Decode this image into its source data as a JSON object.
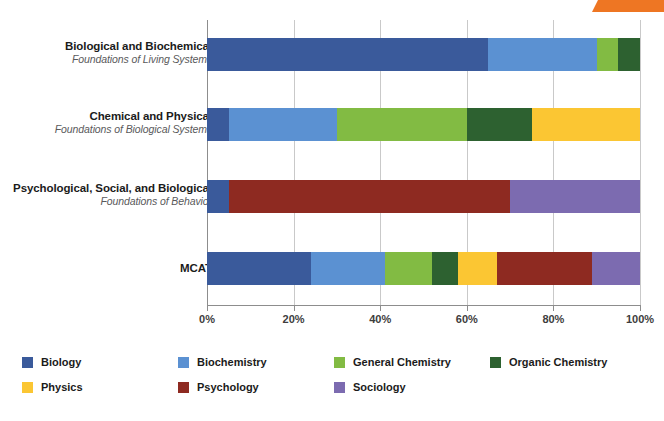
{
  "decor": {
    "corner_flag_color": "#ee7623"
  },
  "chart_data": {
    "type": "bar",
    "orientation": "horizontal",
    "stacked": true,
    "title": "",
    "xlabel": "",
    "ylabel": "",
    "xlim": [
      0,
      100
    ],
    "xticks": [
      0,
      20,
      40,
      60,
      80,
      100
    ],
    "xtick_labels": [
      "0%",
      "20%",
      "40%",
      "60%",
      "80%",
      "100%"
    ],
    "grid": true,
    "grid_axis": "x",
    "legend_position": "bottom",
    "categories": [
      "Biological and Biochemical",
      "Chemical and Physical",
      "Psychological, Social, and Biological",
      "MCAT"
    ],
    "category_subtitles": [
      "Foundations of Living Systems",
      "Foundations of Biological Systems",
      "Foundations of Behavior",
      ""
    ],
    "series": [
      {
        "name": "Biology",
        "color": "#3a5a9b",
        "values": [
          65,
          5,
          5,
          24
        ]
      },
      {
        "name": "Biochemistry",
        "color": "#5b91d2",
        "values": [
          25,
          25,
          0,
          17
        ]
      },
      {
        "name": "General Chemistry",
        "color": "#82bb43",
        "values": [
          5,
          30,
          0,
          11
        ]
      },
      {
        "name": "Organic Chemistry",
        "color": "#2d6130",
        "values": [
          5,
          15,
          0,
          6
        ]
      },
      {
        "name": "Physics",
        "color": "#fbc633",
        "values": [
          0,
          25,
          0,
          9
        ]
      },
      {
        "name": "Psychology",
        "color": "#8e2a21",
        "values": [
          0,
          0,
          65,
          22
        ]
      },
      {
        "name": "Sociology",
        "color": "#7c6bb0",
        "values": [
          0,
          0,
          30,
          11
        ]
      }
    ]
  },
  "legend": {
    "items": [
      {
        "label": "Biology",
        "color": "#3a5a9b"
      },
      {
        "label": "Biochemistry",
        "color": "#5b91d2"
      },
      {
        "label": "General Chemistry",
        "color": "#82bb43"
      },
      {
        "label": "Organic Chemistry",
        "color": "#2d6130"
      },
      {
        "label": "Physics",
        "color": "#fbc633"
      },
      {
        "label": "Psychology",
        "color": "#8e2a21"
      },
      {
        "label": "Sociology",
        "color": "#7c6bb0"
      }
    ]
  }
}
